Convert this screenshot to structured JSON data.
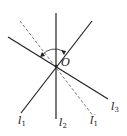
{
  "diagram": {
    "type": "geometry-lines-through-point",
    "point": {
      "label": "O",
      "x": 56,
      "y": 66
    },
    "lines": [
      {
        "id": "l1",
        "label": "l",
        "sub": "1",
        "prime": "",
        "x1": 21,
        "y1": 113,
        "x2": 92,
        "y2": 21,
        "style": "solid",
        "label_x": 18,
        "label_y": 124
      },
      {
        "id": "l2",
        "label": "l",
        "sub": "2",
        "prime": "",
        "x1": 56,
        "y1": 13,
        "x2": 56,
        "y2": 119,
        "style": "solid",
        "label_x": 59,
        "label_y": 126
      },
      {
        "id": "l3",
        "label": "l",
        "sub": "3",
        "prime": "",
        "x1": 8,
        "y1": 37,
        "x2": 108,
        "y2": 99,
        "style": "solid",
        "label_x": 111,
        "label_y": 110
      },
      {
        "id": "l1prime",
        "label": "l",
        "sub": "1",
        "prime": "′",
        "x1": 20,
        "y1": 21,
        "x2": 94,
        "y2": 117,
        "style": "dashed",
        "label_x": 90,
        "label_y": 124
      }
    ],
    "angle_arc": {
      "description": "rotation arc from l1 to l1' about O",
      "arrow": true
    },
    "colors": {
      "line": "#222222",
      "dashed": "#555555"
    }
  }
}
